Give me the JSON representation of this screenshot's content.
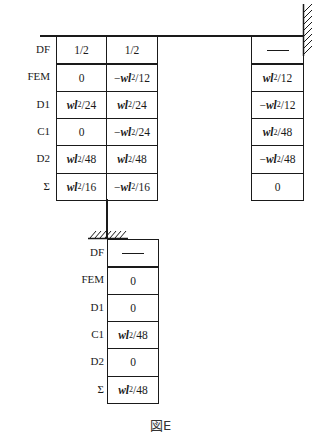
{
  "figure": {
    "caption": "図E",
    "row_labels": [
      "DF",
      "FEM",
      "D1",
      "C1",
      "D2",
      "Σ"
    ],
    "left_joint": {
      "col_left": [
        "1/2",
        "0",
        "wl²/24",
        "0",
        "wl²/48",
        "wl²/16"
      ],
      "col_right": [
        "1/2",
        "−wl²/12",
        "wl²/24",
        "−wl²/24",
        "wl²/48",
        "−wl²/16"
      ]
    },
    "right_fixed_end": {
      "values": [
        "—",
        "wl²/12",
        "−wl²/12",
        "wl²/48",
        "−wl²/48",
        "0"
      ]
    },
    "bottom_fixed_end": {
      "values": [
        "—",
        "0",
        "0",
        "wl²/48",
        "0",
        "wl²/48"
      ]
    }
  }
}
